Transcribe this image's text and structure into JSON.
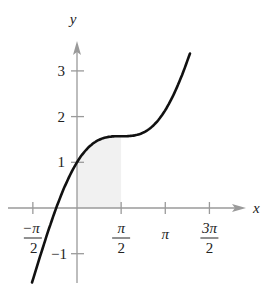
{
  "chart_data": {
    "type": "line",
    "function": "y = x + cos(x)",
    "xlabel": "x",
    "ylabel": "y",
    "x_ticks": [
      {
        "value": -1.5708,
        "label_num": "−π",
        "label_den": "2"
      },
      {
        "value": 1.5708,
        "label_num": "π",
        "label_den": "2"
      },
      {
        "value": 3.1416,
        "label": "π"
      },
      {
        "value": 4.7124,
        "label_num": "3π",
        "label_den": "2"
      }
    ],
    "y_ticks": [
      {
        "value": -1,
        "label": "−1"
      },
      {
        "value": 1,
        "label": "1"
      },
      {
        "value": 2,
        "label": "2"
      },
      {
        "value": 3,
        "label": "3"
      }
    ],
    "shaded_region": {
      "x_from": 0,
      "x_to": 1.5708,
      "color": "#f1f1f1"
    },
    "x_range": [
      -1.6,
      4.02
    ],
    "ylim": [
      -1.6,
      3.6
    ],
    "grid": false,
    "colors": {
      "curve": "#111111",
      "axes": "#9a9a9a",
      "shade": "#f1f1f1"
    }
  }
}
